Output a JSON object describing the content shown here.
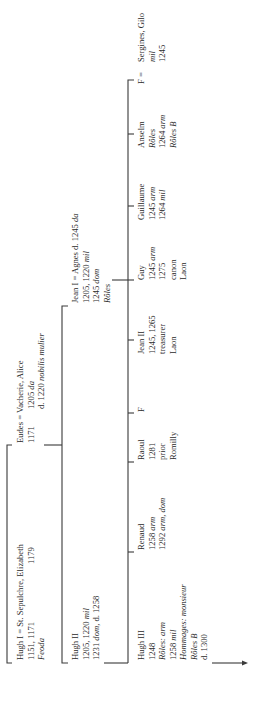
{
  "diagram": {
    "type": "genealogy",
    "orientation": "rotated-90-ccw",
    "generation1": {
      "hugh_i": {
        "line1": "Hugh I = St. Sepulchre, Elizabeth",
        "line2a": "1151, 1171",
        "line2b": "1179",
        "line3": "Feoda"
      },
      "eudes": {
        "line1": "Eudes = Vacherie, Alice",
        "line2a": "1171",
        "line2b": "1205 da",
        "line3": "d. 1220 nobilis mulier"
      }
    },
    "generation2": {
      "hugh_ii": {
        "line1": "Hugh II",
        "line2": "1205, 1220 mil",
        "line3": "1231 dom, d. 1258"
      },
      "jean_i": {
        "line1": "Jean I = Agnes d. 1245 da",
        "line2": "1205, 1220 mil",
        "line3": "1245 dom",
        "line4": "Rôles"
      }
    },
    "generation3": [
      {
        "name": "Hugh III",
        "lines": [
          "1248",
          "Rôles: arm",
          "1258 mil",
          "Hommages: monsieur",
          "Rôles B",
          "d. 1300"
        ]
      },
      {
        "name": "Renaud",
        "lines": [
          "1258 arm",
          "1292 arm, dom"
        ]
      },
      {
        "name": "Raoul",
        "lines": [
          "1281",
          "prior",
          "Romilly"
        ]
      },
      {
        "name": "F",
        "lines": []
      },
      {
        "name": "Jean II",
        "lines": [
          "1245, 1265",
          "treasurer",
          "Laon"
        ]
      },
      {
        "name": "Guy",
        "lines": [
          "1245 arm",
          "1275",
          "canon",
          "Laon"
        ]
      },
      {
        "name": "Guillaume",
        "lines": [
          "1245 arm",
          "1264 mil"
        ]
      },
      {
        "name": "Anselm",
        "lines": [
          "Rôles",
          "1264 arm",
          "Rôles B"
        ]
      },
      {
        "name": "F = Sergines, Gilo",
        "lines": [
          "mil",
          "1245"
        ]
      }
    ],
    "labels": {
      "hugh_i_name": "Hugh I = St. Sepulchre, Elizabeth",
      "hugh_i_dates": "1151, 1171",
      "hugh_i_spouse_date": "1179",
      "hugh_i_source": "Feoda",
      "eudes_name": "Eudes = Vacherie, Alice",
      "eudes_date": "1171",
      "eudes_spouse_date": "1205",
      "eudes_spouse_date_note": "da",
      "eudes_spouse_death": "d. 1220",
      "eudes_spouse_title": "nobilis mulier",
      "hugh_ii_name": "Hugh II",
      "hugh_ii_l2": "1205, 1220",
      "hugh_ii_l2_it": "mil",
      "hugh_ii_l3a": "1231",
      "hugh_ii_l3_it": "dom",
      "hugh_ii_l3b": ", d. 1258",
      "jean_i_name": "Jean I = Agnes d. 1245",
      "jean_i_name_it": "da",
      "jean_i_l2": "1205, 1220",
      "jean_i_l2_it": "mil",
      "jean_i_l3": "1245",
      "jean_i_l3_it": "dom",
      "jean_i_l4": "Rôles",
      "hugh_iii_name": "Hugh III",
      "hugh_iii_l2": "1248",
      "hugh_iii_l3": "Rôles: arm",
      "hugh_iii_l4": "1258",
      "hugh_iii_l4_it": "mil",
      "hugh_iii_l5": "Hommages: monsieur",
      "hugh_iii_l6": "Rôles B",
      "hugh_iii_l7": "d. 1300",
      "renaud_name": "Renaud",
      "renaud_l2": "1258",
      "renaud_l2_it": "arm",
      "renaud_l3": "1292",
      "renaud_l3_it": "arm, dom",
      "raoul_name": "Raoul",
      "raoul_l2": "1281",
      "raoul_l3": "prior",
      "raoul_l4": "Romilly",
      "f1_name": "F",
      "jean_ii_name": "Jean II",
      "jean_ii_l2": "1245, 1265",
      "jean_ii_l3": "treasurer",
      "jean_ii_l4": "Laon",
      "guy_name": "Guy",
      "guy_l2": "1245",
      "guy_l2_it": "arm",
      "guy_l3": "1275",
      "guy_l4": "canon",
      "guy_l5": "Laon",
      "guillaume_name": "Guillaume",
      "guillaume_l2": "1245",
      "guillaume_l2_it": "arm",
      "guillaume_l3": "1264",
      "guillaume_l3_it": "mil",
      "anselm_name": "Anselm",
      "anselm_l2": "Rôles",
      "anselm_l3": "1264",
      "anselm_l3_it": "arm",
      "anselm_l4": "Rôles B",
      "f2_name": "F =",
      "sergines_name": "Sergines, Gilo",
      "sergines_l2": "mil",
      "sergines_l3": "1245"
    }
  }
}
